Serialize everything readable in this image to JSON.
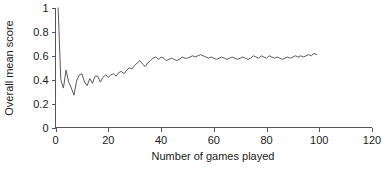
{
  "chart_data": {
    "type": "line",
    "title": "",
    "subtitle": "",
    "xlabel": "Number of games played",
    "ylabel": "Overall mean score",
    "xlim": [
      0,
      120
    ],
    "ylim": [
      0,
      1
    ],
    "xticks": [
      0,
      20,
      40,
      60,
      80,
      100,
      120
    ],
    "xtick_labels": [
      "0",
      "20",
      "40",
      "60",
      "80",
      "100",
      "120"
    ],
    "yticks": [
      0,
      0.2,
      0.4,
      0.6,
      0.8,
      1
    ],
    "ytick_labels": [
      "0",
      "0.2",
      "0.4",
      "0.6",
      "0.8",
      "1"
    ],
    "grid": false,
    "legend": null,
    "legend_position": "none",
    "line_color": "#5a5a5a",
    "axis_color": "#555555",
    "text_color": "#1a1a1a",
    "background_color": "#ffffff",
    "series": [
      {
        "name": "Overall mean score",
        "x": [
          1,
          2,
          3,
          4,
          5,
          6,
          7,
          8,
          9,
          10,
          11,
          12,
          13,
          14,
          15,
          16,
          17,
          18,
          19,
          20,
          21,
          22,
          23,
          24,
          25,
          26,
          27,
          28,
          29,
          30,
          31,
          32,
          33,
          34,
          35,
          36,
          37,
          38,
          39,
          40,
          41,
          42,
          43,
          44,
          45,
          46,
          47,
          48,
          49,
          50,
          51,
          52,
          53,
          54,
          55,
          56,
          57,
          58,
          59,
          60,
          61,
          62,
          63,
          64,
          65,
          66,
          67,
          68,
          69,
          70,
          71,
          72,
          73,
          74,
          75,
          76,
          77,
          78,
          79,
          80,
          81,
          82,
          83,
          84,
          85,
          86,
          87,
          88,
          89,
          90,
          91,
          92,
          93,
          94,
          95,
          96,
          97,
          98,
          99
        ],
        "values": [
          1.0,
          0.4,
          0.33,
          0.48,
          0.38,
          0.33,
          0.27,
          0.39,
          0.44,
          0.45,
          0.38,
          0.35,
          0.41,
          0.37,
          0.43,
          0.43,
          0.38,
          0.42,
          0.44,
          0.42,
          0.44,
          0.45,
          0.43,
          0.46,
          0.47,
          0.45,
          0.48,
          0.5,
          0.49,
          0.52,
          0.54,
          0.56,
          0.53,
          0.51,
          0.54,
          0.56,
          0.58,
          0.59,
          0.57,
          0.59,
          0.58,
          0.56,
          0.57,
          0.58,
          0.57,
          0.56,
          0.57,
          0.59,
          0.58,
          0.58,
          0.59,
          0.6,
          0.59,
          0.6,
          0.61,
          0.6,
          0.59,
          0.58,
          0.59,
          0.58,
          0.57,
          0.58,
          0.59,
          0.58,
          0.57,
          0.58,
          0.59,
          0.58,
          0.57,
          0.58,
          0.59,
          0.58,
          0.57,
          0.58,
          0.6,
          0.59,
          0.58,
          0.6,
          0.59,
          0.58,
          0.6,
          0.59,
          0.58,
          0.59,
          0.58,
          0.57,
          0.58,
          0.59,
          0.58,
          0.59,
          0.6,
          0.59,
          0.6,
          0.59,
          0.6,
          0.61,
          0.6,
          0.62,
          0.61
        ]
      }
    ]
  }
}
